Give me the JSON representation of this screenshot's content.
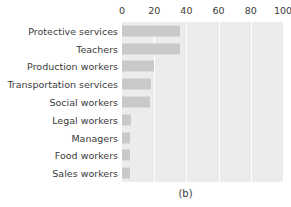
{
  "chart_data": {
    "type": "bar",
    "orientation": "horizontal",
    "title": "",
    "subtitle": "",
    "xlabel": "",
    "ylabel": "",
    "caption": "(b)",
    "categories": [
      "Protective services",
      "Teachers",
      "Production workers",
      "Transportation services",
      "Social workers",
      "Legal workers",
      "Managers",
      "Food workers",
      "Sales workers"
    ],
    "values": [
      36,
      36,
      20,
      18,
      17.5,
      5.5,
      5,
      5,
      5
    ],
    "xlim": [
      0,
      100
    ],
    "xticks": [
      0,
      20,
      40,
      60,
      80,
      100
    ],
    "xtick_labels": [
      "0",
      "20",
      "40",
      "60",
      "80",
      "100"
    ],
    "grid": true,
    "grid_axis": "x",
    "legend": false,
    "axis_position": "top",
    "colors": {
      "bar": "#c9c9c9",
      "plot_background": "#ececec",
      "gridline": "#ffffff",
      "text": "#3a3a3a",
      "figure_background": "#ffffff"
    }
  }
}
